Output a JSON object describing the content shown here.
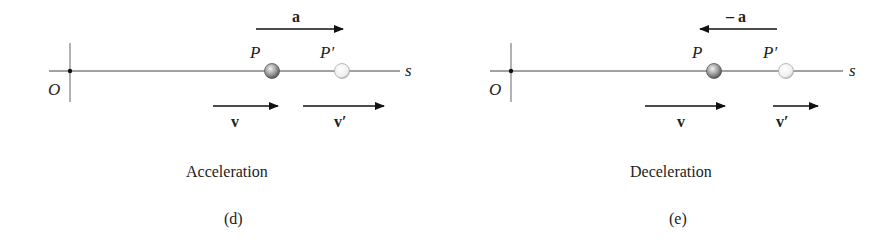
{
  "panels": [
    {
      "id": "d",
      "origin_label": "O",
      "axis_label": "s",
      "point_label": "P",
      "point_prime_label": "P′",
      "accel_label": "a",
      "accel_direction": "right",
      "velocity_label": "v",
      "velocity_prime_label": "v′",
      "caption": "Acceleration",
      "sublabel": "(d)"
    },
    {
      "id": "e",
      "origin_label": "O",
      "axis_label": "s",
      "point_label": "P",
      "point_prime_label": "P′",
      "accel_label": "– a",
      "accel_direction": "left",
      "velocity_label": "v",
      "velocity_prime_label": "v′",
      "caption": "Deceleration",
      "sublabel": "(e)"
    }
  ]
}
